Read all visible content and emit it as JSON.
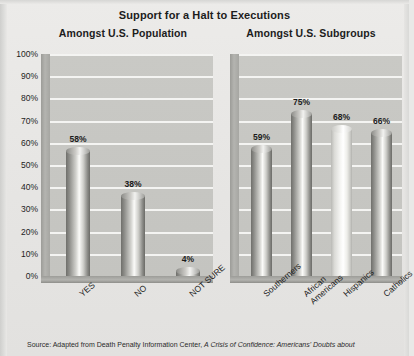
{
  "figure": {
    "title": "Support for a Halt to Executions",
    "source_prefix": "Source: Adapted from Death Penalty Information Center, ",
    "source_italic": "A Crisis of Confidence: Americans' Doubts about"
  },
  "panels": {
    "left_title": "Amongst U.S. Population",
    "right_title": "Amongst U.S. Subgroups"
  },
  "axis": {
    "ticks": [
      "100%",
      "90%",
      "80%",
      "70%",
      "60%",
      "50%",
      "40%",
      "30%",
      "20%",
      "10%",
      "0%"
    ]
  },
  "chart_data": [
    {
      "type": "bar",
      "title": "Amongst U.S. Population",
      "categories": [
        "YES",
        "NO",
        "NOT SURE"
      ],
      "values": [
        58,
        38,
        4
      ],
      "value_labels": [
        "58%",
        "38%",
        "4%"
      ],
      "xlabel": "",
      "ylabel": "",
      "ylim": [
        0,
        100
      ],
      "ytick_step": 10,
      "grid": true,
      "legend": "none",
      "style": "3d-cylinder"
    },
    {
      "type": "bar",
      "title": "Amongst U.S. Subgroups",
      "categories": [
        "Southerners",
        "African\nAmericans",
        "Hispanics",
        "Catholics"
      ],
      "values": [
        59,
        75,
        68,
        66
      ],
      "value_labels": [
        "59%",
        "75%",
        "68%",
        "66%"
      ],
      "xlabel": "",
      "ylabel": "",
      "ylim": [
        0,
        100
      ],
      "ytick_step": 10,
      "grid": true,
      "legend": "none",
      "style": "3d-cylinder",
      "highlight_index": 2
    }
  ],
  "colors": {
    "page_background": "#e9e8e6",
    "plot_background": "#c7c7c3",
    "gridline": "#f4f4f2",
    "bar_dark": "#6f6f6b",
    "bar_light": "#fbfbf9",
    "text": "#1b1b1b"
  }
}
